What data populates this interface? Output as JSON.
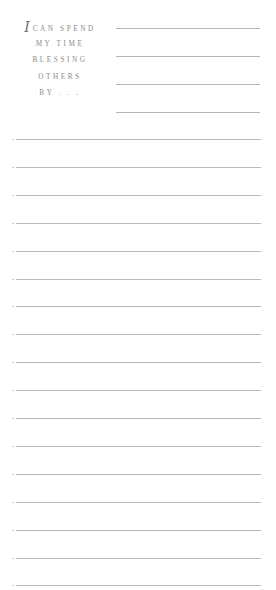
{
  "prompt": {
    "initial": "I",
    "lines": [
      "CAN SPEND",
      "MY TIME",
      "BLESSING",
      "OTHERS",
      "BY . . ."
    ]
  },
  "short_lines": {
    "count": 4,
    "top": 28,
    "spacing": 28
  },
  "long_lines": {
    "count": 17,
    "top": 139,
    "spacing": 27.9
  },
  "colors": {
    "line": "#b8b8b8",
    "text": "#8a8a8a",
    "background": "#ffffff"
  }
}
